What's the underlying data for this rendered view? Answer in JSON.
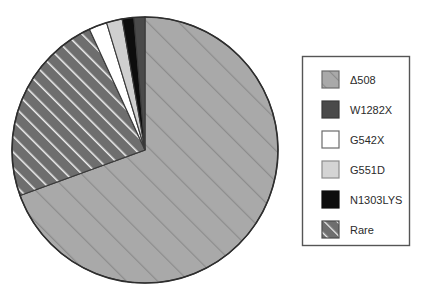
{
  "figure": {
    "type": "pie-chart-figure",
    "background": "#ffffff"
  },
  "chart_data": {
    "type": "pie",
    "title": "",
    "subtitle": "",
    "xlabel": "",
    "ylabel": "",
    "grid": false,
    "legend_position": "right",
    "start_angle_deg": 0,
    "direction": "clockwise",
    "center": {
      "x": 145,
      "y": 150
    },
    "radius": 133,
    "categories": [
      "Δ508",
      "W1282X",
      "G542X",
      "G551D",
      "N1303LYS",
      "Rare"
    ],
    "values": [
      69.4,
      1.4,
      2.2,
      1.9,
      1.4,
      23.7
    ],
    "slices": [
      {
        "label": "Δ508",
        "value": 69.4,
        "start_deg": 0,
        "end_deg": 250,
        "fill": "#a9a9a9",
        "pattern": "diagonal-hatch-wide",
        "pattern_stroke": "#8c8c8c",
        "stroke": "#3a3a3a"
      },
      {
        "label": "Rare",
        "value": 23.7,
        "start_deg": 250,
        "end_deg": 335.3,
        "fill": "#6e6e6e",
        "pattern": "diagonal-hatch-dense",
        "pattern_stroke": "#f2f2f2",
        "stroke": "#3a3a3a"
      },
      {
        "label": "G542X",
        "value": 2.2,
        "start_deg": 335.3,
        "end_deg": 343.2,
        "fill": "#ffffff",
        "pattern": "solid",
        "pattern_stroke": "",
        "stroke": "#3a3a3a"
      },
      {
        "label": "G551D",
        "value": 1.9,
        "start_deg": 343.2,
        "end_deg": 350.1,
        "fill": "#cfcfcf",
        "pattern": "solid",
        "pattern_stroke": "",
        "stroke": "#3a3a3a"
      },
      {
        "label": "N1303LYS",
        "value": 1.4,
        "start_deg": 350.1,
        "end_deg": 355.2,
        "fill": "#0d0d0d",
        "pattern": "solid",
        "pattern_stroke": "",
        "stroke": "#3a3a3a"
      },
      {
        "label": "W1282X",
        "value": 1.4,
        "start_deg": 355.2,
        "end_deg": 360,
        "fill": "#4a4a4a",
        "pattern": "solid",
        "pattern_stroke": "",
        "stroke": "#3a3a3a"
      }
    ]
  },
  "legend": {
    "border_color": "#555555",
    "background": "#ffffff",
    "box": {
      "x": 302,
      "y": 56,
      "width": 108,
      "height": 190
    },
    "items": [
      {
        "label": "Δ508",
        "fill": "#a9a9a9",
        "pattern": "diagonal-hatch-wide",
        "pattern_stroke": "#8c8c8c",
        "swatch_border": "#6b6b6b"
      },
      {
        "label": "W1282X",
        "fill": "#4a4a4a",
        "pattern": "solid",
        "pattern_stroke": "",
        "swatch_border": "#3a3a3a"
      },
      {
        "label": "G542X",
        "fill": "#ffffff",
        "pattern": "solid",
        "pattern_stroke": "",
        "swatch_border": "#6b6b6b"
      },
      {
        "label": "G551D",
        "fill": "#d4d4d4",
        "pattern": "solid",
        "pattern_stroke": "",
        "swatch_border": "#8c8c8c"
      },
      {
        "label": "N1303LYS",
        "fill": "#0d0d0d",
        "pattern": "solid",
        "pattern_stroke": "",
        "swatch_border": "#0d0d0d"
      },
      {
        "label": "Rare",
        "fill": "#6e6e6e",
        "pattern": "diagonal-hatch-dense",
        "pattern_stroke": "#f2f2f2",
        "swatch_border": "#4a4a4a"
      }
    ]
  }
}
